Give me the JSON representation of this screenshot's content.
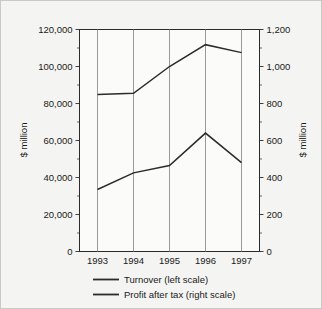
{
  "chart_data": {
    "type": "line",
    "title": "",
    "xlabel": "",
    "ylabel": "$ million",
    "y2label": "$ million",
    "categories": [
      "1993",
      "1994",
      "1995",
      "1996",
      "1997"
    ],
    "x": [
      1993,
      1994,
      1995,
      1996,
      1997
    ],
    "grid": true,
    "grid_orientation": "vertical",
    "legend_position": "bottom",
    "left_axis": {
      "label": "$ million",
      "ylim": [
        0,
        120000
      ],
      "ticks": [
        0,
        20000,
        40000,
        60000,
        80000,
        100000,
        120000
      ],
      "tick_labels": [
        "0",
        "20,000",
        "40,000",
        "60,000",
        "80,000",
        "100,000",
        "120,000"
      ],
      "minor_tick_step": 10000
    },
    "right_axis": {
      "label": "$ million",
      "ylim": [
        0,
        1200
      ],
      "ticks": [
        0,
        200,
        400,
        600,
        800,
        1000,
        1200
      ],
      "tick_labels": [
        "0",
        "200",
        "400",
        "600",
        "800",
        "1,000",
        "1,200"
      ],
      "minor_tick_step": 100
    },
    "series": [
      {
        "name": "Turnover (left scale)",
        "axis": "left",
        "legend_label": "Turnover (left scale)",
        "color": "#2b2b2b",
        "values": [
          84800,
          85500,
          100000,
          111800,
          107500
        ]
      },
      {
        "name": "Profit after tax (right scale)",
        "axis": "right",
        "legend_label": "Profit after tax (right scale)",
        "color": "#2b2b2b",
        "values": [
          335,
          425,
          465,
          640,
          480
        ]
      }
    ]
  },
  "legend": {
    "items": [
      {
        "label": "Turnover (left scale)"
      },
      {
        "label": "Profit after tax (right scale)"
      }
    ]
  },
  "axes": {
    "left_title": "$ million",
    "right_title": "$ million",
    "x_tick_labels": [
      "1993",
      "1994",
      "1995",
      "1996",
      "1997"
    ],
    "left_tick_labels": [
      "120,000",
      "100,000",
      "80,000",
      "60,000",
      "40,000",
      "20,000",
      "0"
    ],
    "right_tick_labels": [
      "1,200",
      "1,000",
      "800",
      "600",
      "400",
      "200",
      "0"
    ]
  },
  "colors": {
    "background": "#f4f4f2",
    "plot_background": "#fbfbfa",
    "line": "#2b2b2b",
    "grid": "#8e8e8e",
    "text": "#1a1a1a",
    "border": "#c9c9c6"
  }
}
